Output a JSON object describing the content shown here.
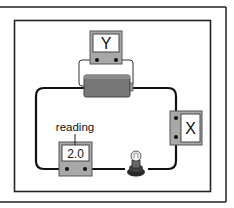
{
  "diagram": {
    "type": "electric-circuit",
    "colors": {
      "frame": "#222222",
      "wire": "#111111",
      "meter_body": "#a8a8a8",
      "meter_display": "#ffffff",
      "battery": "#777777",
      "lamp_base": "#333333"
    },
    "components": {
      "meter_y": {
        "label": "Y",
        "connection": "parallel across cell"
      },
      "meter_x": {
        "label": "X",
        "connection": "series"
      },
      "ammeter": {
        "display": "2.0",
        "callout": "reading",
        "connection": "series"
      },
      "cell": {
        "label": ""
      },
      "lamp": {
        "label": ""
      }
    }
  }
}
